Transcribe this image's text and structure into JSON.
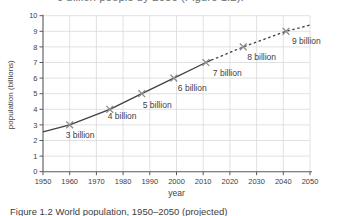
{
  "page": {
    "top_text_fragment": "9 billion people by 2050 (Figure 1.2).",
    "caption": "Figure 1.2 World population, 1950–2050 (projected)"
  },
  "chart_data": {
    "type": "line",
    "title": "",
    "xlabel": "year",
    "ylabel": "population (billions)",
    "xlim": [
      1950,
      2050
    ],
    "ylim": [
      0,
      10
    ],
    "x_ticks": [
      1950,
      1960,
      1970,
      1980,
      1990,
      2000,
      2010,
      2020,
      2030,
      2040,
      2050
    ],
    "y_ticks": [
      0,
      1,
      2,
      3,
      4,
      5,
      6,
      7,
      8,
      9,
      10
    ],
    "grid": true,
    "legend": "none",
    "series": [
      {
        "name": "actual",
        "style": "solid",
        "points": [
          [
            1950,
            2.55
          ],
          [
            1960,
            3
          ],
          [
            1975,
            4
          ],
          [
            1987,
            5
          ],
          [
            1999,
            6
          ],
          [
            2011,
            7
          ],
          [
            2013,
            7.15
          ]
        ]
      },
      {
        "name": "projected",
        "style": "dashed",
        "points": [
          [
            2013,
            7.15
          ],
          [
            2025,
            8
          ],
          [
            2041,
            9
          ],
          [
            2050,
            9.4
          ]
        ]
      }
    ],
    "milestones": [
      {
        "year": 1960,
        "value": 3,
        "label": "3 billion",
        "dx": -4,
        "dy": 13
      },
      {
        "year": 1975,
        "value": 4,
        "label": "4 billion",
        "dx": -2,
        "dy": 10
      },
      {
        "year": 1987,
        "value": 5,
        "label": "5 billion",
        "dx": 1,
        "dy": 14
      },
      {
        "year": 1999,
        "value": 6,
        "label": "6 billion",
        "dx": 4,
        "dy": 13
      },
      {
        "year": 2011,
        "value": 7,
        "label": "7 billion",
        "dx": 7,
        "dy": 13
      },
      {
        "year": 2025,
        "value": 8,
        "label": "8 billion",
        "dx": 4,
        "dy": 13
      },
      {
        "year": 2041,
        "value": 9,
        "label": "9 billion",
        "dx": 6,
        "dy": 13
      }
    ],
    "colors": {
      "line": "#414042",
      "marker": "#8a8c8e",
      "grid": "#d8d9da",
      "axis": "#58595b",
      "text": "#414042",
      "background": "#ffffff"
    }
  }
}
